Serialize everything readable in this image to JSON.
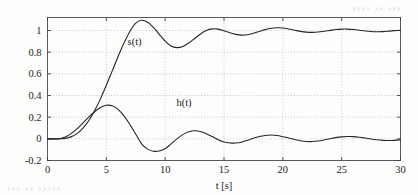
{
  "chart_data": {
    "type": "line",
    "title": "",
    "xlabel": "t [s]",
    "ylabel": "",
    "xlim": [
      0,
      30
    ],
    "ylim": [
      -0.2,
      1.12
    ],
    "grid": true,
    "grid_style": "dotted",
    "legend_position": "inline-annotation",
    "xticks": [
      0,
      5,
      10,
      15,
      20,
      25,
      30
    ],
    "xticklabels": [
      "0",
      "5",
      "10",
      "15",
      "20",
      "25",
      "30"
    ],
    "yticks": [
      -0.2,
      0,
      0.2,
      0.4,
      0.6,
      0.8,
      1
    ],
    "yticklabels": [
      "-0.2",
      "0",
      "0.2",
      "0.4",
      "0.6",
      "0.8",
      "1"
    ],
    "annotations": [
      {
        "text": "s(t)",
        "x": 7.4,
        "y": 0.87
      },
      {
        "text": "h(t)",
        "x": 11.6,
        "y": 0.3
      }
    ],
    "series": [
      {
        "name": "s(t)",
        "description": "step response of second order system with dead time",
        "color": "#262626",
        "linewidth": 1.1,
        "x": [
          0,
          0.5,
          1,
          1.5,
          2,
          2.5,
          3,
          3.5,
          4,
          4.5,
          5,
          5.5,
          6,
          6.5,
          7,
          7.5,
          8,
          8.5,
          9,
          9.5,
          10,
          10.5,
          11,
          11.5,
          12,
          12.5,
          13,
          13.5,
          14,
          14.5,
          15,
          15.5,
          16,
          16.5,
          17,
          17.5,
          18,
          18.5,
          19,
          19.5,
          20,
          20.5,
          21,
          21.5,
          22,
          22.5,
          23,
          23.5,
          24,
          24.5,
          25,
          25.5,
          26,
          26.5,
          27,
          27.5,
          28,
          28.5,
          29,
          29.5,
          30
        ],
        "y": [
          0,
          0,
          0,
          0.004,
          0.018,
          0.048,
          0.097,
          0.167,
          0.259,
          0.369,
          0.494,
          0.627,
          0.76,
          0.884,
          0.991,
          1.068,
          1.094,
          1.077,
          1.029,
          0.965,
          0.901,
          0.856,
          0.842,
          0.853,
          0.884,
          0.926,
          0.968,
          1.0,
          1.015,
          1.013,
          0.998,
          0.979,
          0.964,
          0.957,
          0.961,
          0.974,
          0.991,
          1.008,
          1.02,
          1.025,
          1.023,
          1.014,
          1.003,
          0.992,
          0.985,
          0.983,
          0.986,
          0.993,
          1.001,
          1.009,
          1.013,
          1.013,
          1.009,
          1.003,
          0.996,
          0.991,
          0.989,
          0.99,
          0.994,
          0.999,
          1.003
        ]
      },
      {
        "name": "h(t)",
        "description": "impulse response of second order system with dead time",
        "color": "#262626",
        "linewidth": 1.1,
        "x": [
          0,
          0.5,
          1,
          1.5,
          2,
          2.5,
          3,
          3.5,
          4,
          4.5,
          5,
          5.5,
          6,
          6.5,
          7,
          7.5,
          8,
          8.5,
          9,
          9.5,
          10,
          10.5,
          11,
          11.5,
          12,
          12.5,
          13,
          13.5,
          14,
          14.5,
          15,
          15.5,
          16,
          16.5,
          17,
          17.5,
          18,
          18.5,
          19,
          19.5,
          20,
          20.5,
          21,
          21.5,
          22,
          22.5,
          23,
          23.5,
          24,
          24.5,
          25,
          25.5,
          26,
          26.5,
          27,
          27.5,
          28,
          28.5,
          29,
          29.5,
          30
        ],
        "y": [
          0,
          0,
          0,
          0.016,
          0.048,
          0.092,
          0.145,
          0.2,
          0.25,
          0.289,
          0.31,
          0.305,
          0.272,
          0.212,
          0.133,
          0.043,
          -0.046,
          -0.095,
          -0.114,
          -0.112,
          -0.092,
          -0.047,
          0.0,
          0.039,
          0.065,
          0.074,
          0.068,
          0.048,
          0.021,
          -0.008,
          -0.029,
          -0.038,
          -0.039,
          -0.031,
          -0.013,
          0.006,
          0.021,
          0.031,
          0.035,
          0.031,
          0.02,
          0.007,
          -0.006,
          -0.017,
          -0.024,
          -0.025,
          -0.02,
          -0.01,
          0.001,
          0.011,
          0.018,
          0.021,
          0.02,
          0.015,
          0.007,
          -0.002,
          -0.009,
          -0.014,
          -0.016,
          -0.014,
          -0.009
        ]
      }
    ]
  },
  "artifacts": {
    "top_bleed": "‹‹‹ ‹‹ ‹‹‹‹",
    "bottom_bleed": "‹‹‹‹‹ ‹‹ ‹‹‹"
  }
}
